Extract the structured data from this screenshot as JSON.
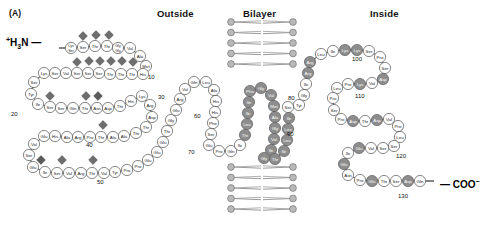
{
  "figure": {
    "panel_label": "(A)",
    "n_terminus": "+H3N",
    "c_terminus": "COO-",
    "regions": [
      {
        "name": "outside",
        "label": "Outside"
      },
      {
        "name": "bilayer",
        "label": "Bilayer"
      },
      {
        "name": "inside",
        "label": "Inside"
      }
    ],
    "colors": {
      "residue_plain_fill": "#ffffff",
      "residue_plain_stroke": "#555555",
      "residue_shaded_fill": "#8d8d8d",
      "residue_dark_fill": "#6f6f6f",
      "glycan_diamond": "#6e6e6e",
      "glycan_diamond_dark": "#5a5a5a",
      "lipid_head": "#b9b9b9",
      "lipid_head_stroke": "#6a6a6a",
      "lipid_tail": "#9a9a9a",
      "text": "#1a1a1a"
    },
    "position_markers": [
      {
        "label": "10",
        "x": 148,
        "y": 74
      },
      {
        "label": "20",
        "x": 11,
        "y": 111
      },
      {
        "label": "30",
        "x": 158,
        "y": 94
      },
      {
        "label": "40",
        "x": 86,
        "y": 142
      },
      {
        "label": "50",
        "x": 97,
        "y": 179
      },
      {
        "label": "60",
        "x": 194,
        "y": 113
      },
      {
        "label": "70",
        "x": 188,
        "y": 149
      },
      {
        "label": "80",
        "x": 288,
        "y": 95
      },
      {
        "label": "90",
        "x": 287,
        "y": 131
      },
      {
        "label": "100",
        "x": 352,
        "y": 56
      },
      {
        "label": "110",
        "x": 355,
        "y": 93
      },
      {
        "label": "120",
        "x": 396,
        "y": 153
      },
      {
        "label": "130",
        "x": 398,
        "y": 193
      }
    ],
    "residues": [
      {
        "i": 1,
        "name": "Lys\nSer",
        "x": 71,
        "y": 48,
        "style": "plain",
        "w": 11
      },
      {
        "i": 2,
        "name": "Ser",
        "x": 83,
        "y": 47,
        "style": "plain"
      },
      {
        "i": 3,
        "name": "Thr",
        "x": 95,
        "y": 46,
        "style": "plain"
      },
      {
        "i": 4,
        "name": "Thr",
        "x": 107,
        "y": 46,
        "style": "plain"
      },
      {
        "i": 5,
        "name": "Gly\nGly",
        "x": 118,
        "y": 48,
        "style": "plain"
      },
      {
        "i": 6,
        "name": "Val",
        "x": 130,
        "y": 48,
        "style": "plain"
      },
      {
        "i": 7,
        "name": "Ala",
        "x": 140,
        "y": 56,
        "style": "plain"
      },
      {
        "i": 8,
        "name": "Met",
        "x": 146,
        "y": 66,
        "style": "plain"
      },
      {
        "i": 9,
        "name": "His",
        "x": 143,
        "y": 74,
        "style": "plain"
      },
      {
        "i": 10,
        "name": "Thr",
        "x": 132,
        "y": 74,
        "style": "plain"
      },
      {
        "i": 11,
        "name": "Thr",
        "x": 121,
        "y": 74,
        "style": "plain"
      },
      {
        "i": 12,
        "name": "Thr",
        "x": 110,
        "y": 74,
        "style": "plain"
      },
      {
        "i": 13,
        "name": "Ser",
        "x": 99,
        "y": 73,
        "style": "plain"
      },
      {
        "i": 14,
        "name": "Ser",
        "x": 88,
        "y": 73,
        "style": "plain"
      },
      {
        "i": 15,
        "name": "Ser",
        "x": 77,
        "y": 73,
        "style": "plain"
      },
      {
        "i": 16,
        "name": "Val",
        "x": 66,
        "y": 73,
        "style": "plain"
      },
      {
        "i": 17,
        "name": "Ser",
        "x": 55,
        "y": 73,
        "style": "plain"
      },
      {
        "i": 18,
        "name": "Lys",
        "x": 44,
        "y": 73,
        "style": "plain"
      },
      {
        "i": 19,
        "name": "Ser",
        "x": 34,
        "y": 82,
        "style": "plain"
      },
      {
        "i": 20,
        "name": "Tyr",
        "x": 31,
        "y": 94,
        "style": "plain"
      },
      {
        "i": 21,
        "name": "Ile",
        "x": 38,
        "y": 104,
        "style": "plain"
      },
      {
        "i": 22,
        "name": "Ser",
        "x": 50,
        "y": 107,
        "style": "plain"
      },
      {
        "i": 23,
        "name": "Ser",
        "x": 61,
        "y": 108,
        "style": "plain"
      },
      {
        "i": 24,
        "name": "Gln",
        "x": 73,
        "y": 108,
        "style": "plain"
      },
      {
        "i": 25,
        "name": "Thr",
        "x": 85,
        "y": 108,
        "style": "plain"
      },
      {
        "i": 26,
        "name": "Asn",
        "x": 97,
        "y": 108,
        "style": "plain"
      },
      {
        "i": 27,
        "name": "Asp",
        "x": 108,
        "y": 108,
        "style": "plain"
      },
      {
        "i": 28,
        "name": "Thr",
        "x": 120,
        "y": 106,
        "style": "plain"
      },
      {
        "i": 29,
        "name": "His",
        "x": 131,
        "y": 101,
        "style": "plain"
      },
      {
        "i": 30,
        "name": "Lys",
        "x": 142,
        "y": 96,
        "style": "plain"
      },
      {
        "i": 31,
        "name": "Arg",
        "x": 150,
        "y": 105,
        "style": "plain"
      },
      {
        "i": 32,
        "name": "Asp",
        "x": 152,
        "y": 117,
        "style": "plain"
      },
      {
        "i": 33,
        "name": "Thr",
        "x": 146,
        "y": 127,
        "style": "plain"
      },
      {
        "i": 34,
        "name": "Thr",
        "x": 136,
        "y": 133,
        "style": "plain"
      },
      {
        "i": 35,
        "name": "Ala",
        "x": 124,
        "y": 136,
        "style": "plain"
      },
      {
        "i": 36,
        "name": "Ala",
        "x": 113,
        "y": 137,
        "style": "plain"
      },
      {
        "i": 37,
        "name": "Thr",
        "x": 101,
        "y": 137,
        "style": "plain"
      },
      {
        "i": 38,
        "name": "Pro",
        "x": 90,
        "y": 137,
        "style": "plain"
      },
      {
        "i": 39,
        "name": "Arg",
        "x": 78,
        "y": 137,
        "style": "plain"
      },
      {
        "i": 40,
        "name": "Ala",
        "x": 67,
        "y": 137,
        "style": "plain"
      },
      {
        "i": 41,
        "name": "His",
        "x": 55,
        "y": 136,
        "style": "plain"
      },
      {
        "i": 42,
        "name": "Glu",
        "x": 44,
        "y": 136,
        "style": "plain"
      },
      {
        "i": 43,
        "name": "Val",
        "x": 34,
        "y": 144,
        "style": "plain"
      },
      {
        "i": 44,
        "name": "Ser",
        "x": 29,
        "y": 155,
        "style": "plain"
      },
      {
        "i": 45,
        "name": "Glu",
        "x": 33,
        "y": 167,
        "style": "plain"
      },
      {
        "i": 46,
        "name": "Ile",
        "x": 45,
        "y": 172,
        "style": "plain"
      },
      {
        "i": 47,
        "name": "Ser",
        "x": 57,
        "y": 173,
        "style": "plain"
      },
      {
        "i": 48,
        "name": "Val",
        "x": 69,
        "y": 173,
        "style": "plain"
      },
      {
        "i": 49,
        "name": "Arg",
        "x": 81,
        "y": 173,
        "style": "plain"
      },
      {
        "i": 50,
        "name": "Thr",
        "x": 92,
        "y": 173,
        "style": "plain"
      },
      {
        "i": 51,
        "name": "Val",
        "x": 104,
        "y": 173,
        "style": "plain"
      },
      {
        "i": 52,
        "name": "Tyr",
        "x": 115,
        "y": 172,
        "style": "plain"
      },
      {
        "i": 53,
        "name": "Pro",
        "x": 127,
        "y": 170,
        "style": "plain"
      },
      {
        "i": 54,
        "name": "Pro",
        "x": 138,
        "y": 166,
        "style": "plain"
      },
      {
        "i": 55,
        "name": "Glu",
        "x": 148,
        "y": 160,
        "style": "plain"
      },
      {
        "i": 56,
        "name": "Glu",
        "x": 157,
        "y": 152,
        "style": "plain"
      },
      {
        "i": 57,
        "name": "Glu",
        "x": 163,
        "y": 142,
        "style": "plain"
      },
      {
        "i": 58,
        "name": "Thr",
        "x": 167,
        "y": 131,
        "style": "plain"
      },
      {
        "i": 59,
        "name": "Gly",
        "x": 171,
        "y": 120,
        "style": "plain"
      },
      {
        "i": 60,
        "name": "Glu",
        "x": 176,
        "y": 110,
        "style": "plain"
      },
      {
        "i": 61,
        "name": "Arg",
        "x": 180,
        "y": 99,
        "style": "plain"
      },
      {
        "i": 62,
        "name": "Val",
        "x": 185,
        "y": 89,
        "style": "plain"
      },
      {
        "i": 63,
        "name": "Gln",
        "x": 194,
        "y": 82,
        "style": "plain"
      },
      {
        "i": 64,
        "name": "Leu",
        "x": 206,
        "y": 82,
        "style": "plain"
      },
      {
        "i": 65,
        "name": "Ala",
        "x": 214,
        "y": 90,
        "style": "plain"
      },
      {
        "i": 66,
        "name": "His",
        "x": 216,
        "y": 101,
        "style": "plain"
      },
      {
        "i": 67,
        "name": "His",
        "x": 215,
        "y": 112,
        "style": "plain"
      },
      {
        "i": 68,
        "name": "Phe",
        "x": 213,
        "y": 123,
        "style": "plain"
      },
      {
        "i": 69,
        "name": "Ser",
        "x": 211,
        "y": 134,
        "style": "plain"
      },
      {
        "i": 70,
        "name": "Glu",
        "x": 209,
        "y": 145,
        "style": "plain"
      },
      {
        "i": 71,
        "name": "Pro",
        "x": 219,
        "y": 151,
        "style": "plain"
      },
      {
        "i": 72,
        "name": "Gln",
        "x": 231,
        "y": 151,
        "style": "plain"
      },
      {
        "i": 73,
        "name": "Ile",
        "x": 240,
        "y": 145,
        "style": "plain"
      },
      {
        "i": 74,
        "name": "Thr",
        "x": 245,
        "y": 135,
        "style": "shaded"
      },
      {
        "i": 75,
        "name": "Leu",
        "x": 247,
        "y": 124,
        "style": "shaded"
      },
      {
        "i": 76,
        "name": "Ile",
        "x": 248,
        "y": 113,
        "style": "shaded"
      },
      {
        "i": 77,
        "name": "Ile",
        "x": 249,
        "y": 102,
        "style": "shaded"
      },
      {
        "i": 78,
        "name": "Phe",
        "x": 250,
        "y": 91,
        "style": "shaded"
      },
      {
        "i": 79,
        "name": "Gly",
        "x": 261,
        "y": 88,
        "style": "shaded"
      },
      {
        "i": 80,
        "name": "Val",
        "x": 271,
        "y": 95,
        "style": "shaded"
      },
      {
        "i": 81,
        "name": "Met",
        "x": 274,
        "y": 106,
        "style": "shaded"
      },
      {
        "i": 82,
        "name": "Ala",
        "x": 275,
        "y": 117,
        "style": "shaded"
      },
      {
        "i": 83,
        "name": "Gly",
        "x": 275,
        "y": 128,
        "style": "shaded"
      },
      {
        "i": 84,
        "name": "Val",
        "x": 274,
        "y": 139,
        "style": "shaded"
      },
      {
        "i": 85,
        "name": "Ile",
        "x": 271,
        "y": 150,
        "style": "shaded"
      },
      {
        "i": 86,
        "name": "Gly",
        "x": 264,
        "y": 158,
        "style": "shaded"
      },
      {
        "i": 87,
        "name": "Thr",
        "x": 275,
        "y": 159,
        "style": "shaded"
      },
      {
        "i": 88,
        "name": "Ile",
        "x": 284,
        "y": 151,
        "style": "shaded"
      },
      {
        "i": 89,
        "name": "Leu",
        "x": 287,
        "y": 140,
        "style": "shaded"
      },
      {
        "i": 90,
        "name": "Leu",
        "x": 288,
        "y": 129,
        "style": "shaded"
      },
      {
        "i": 91,
        "name": "Ile",
        "x": 289,
        "y": 118,
        "style": "shaded"
      },
      {
        "i": 92,
        "name": "Ser",
        "x": 288,
        "y": 107,
        "style": "plain"
      },
      {
        "i": 93,
        "name": "Tyr",
        "x": 299,
        "y": 105,
        "style": "plain"
      },
      {
        "i": 94,
        "name": "Gly",
        "x": 304,
        "y": 95,
        "style": "plain"
      },
      {
        "i": 95,
        "name": "Ile",
        "x": 306,
        "y": 84,
        "style": "plain"
      },
      {
        "i": 96,
        "name": "Arg",
        "x": 308,
        "y": 73,
        "style": "shaded"
      },
      {
        "i": 97,
        "name": "Arg",
        "x": 310,
        "y": 62,
        "style": "shaded"
      },
      {
        "i": 98,
        "name": "Leu",
        "x": 321,
        "y": 54,
        "style": "plain"
      },
      {
        "i": 99,
        "name": "Ile",
        "x": 333,
        "y": 51,
        "style": "plain"
      },
      {
        "i": 100,
        "name": "Lys",
        "x": 345,
        "y": 50,
        "style": "shaded"
      },
      {
        "i": 101,
        "name": "Lys",
        "x": 357,
        "y": 50,
        "style": "shaded"
      },
      {
        "i": 102,
        "name": "Ser",
        "x": 369,
        "y": 51,
        "style": "plain"
      },
      {
        "i": 103,
        "name": "Pro",
        "x": 380,
        "y": 57,
        "style": "plain"
      },
      {
        "i": 104,
        "name": "Ser",
        "x": 385,
        "y": 68,
        "style": "plain"
      },
      {
        "i": 105,
        "name": "Asp",
        "x": 383,
        "y": 79,
        "style": "shaded"
      },
      {
        "i": 106,
        "name": "Val",
        "x": 372,
        "y": 83,
        "style": "plain"
      },
      {
        "i": 107,
        "name": "Lys",
        "x": 360,
        "y": 84,
        "style": "shaded"
      },
      {
        "i": 108,
        "name": "Pro",
        "x": 348,
        "y": 84,
        "style": "plain"
      },
      {
        "i": 109,
        "name": "Leu",
        "x": 337,
        "y": 88,
        "style": "plain"
      },
      {
        "i": 110,
        "name": "Pro",
        "x": 333,
        "y": 98,
        "style": "plain"
      },
      {
        "i": 111,
        "name": "Ser",
        "x": 334,
        "y": 110,
        "style": "plain"
      },
      {
        "i": 112,
        "name": "Pro",
        "x": 341,
        "y": 119,
        "style": "plain"
      },
      {
        "i": 113,
        "name": "Asp",
        "x": 353,
        "y": 121,
        "style": "shaded"
      },
      {
        "i": 114,
        "name": "Thr",
        "x": 365,
        "y": 121,
        "style": "plain"
      },
      {
        "i": 115,
        "name": "Asp",
        "x": 377,
        "y": 120,
        "style": "shaded"
      },
      {
        "i": 116,
        "name": "Val",
        "x": 389,
        "y": 119,
        "style": "plain"
      },
      {
        "i": 117,
        "name": "Pro",
        "x": 398,
        "y": 126,
        "style": "plain"
      },
      {
        "i": 118,
        "name": "Leu",
        "x": 400,
        "y": 137,
        "style": "plain"
      },
      {
        "i": 119,
        "name": "Ser",
        "x": 394,
        "y": 146,
        "style": "plain"
      },
      {
        "i": 120,
        "name": "Ser",
        "x": 383,
        "y": 148,
        "style": "plain"
      },
      {
        "i": 121,
        "name": "Val",
        "x": 371,
        "y": 148,
        "style": "plain"
      },
      {
        "i": 122,
        "name": "Glu",
        "x": 359,
        "y": 148,
        "style": "shaded"
      },
      {
        "i": 123,
        "name": "Ile",
        "x": 348,
        "y": 153,
        "style": "plain"
      },
      {
        "i": 124,
        "name": "Glu",
        "x": 344,
        "y": 164,
        "style": "shaded"
      },
      {
        "i": 125,
        "name": "Asn",
        "x": 348,
        "y": 175,
        "style": "plain"
      },
      {
        "i": 126,
        "name": "Pro",
        "x": 360,
        "y": 180,
        "style": "plain"
      },
      {
        "i": 127,
        "name": "Glu",
        "x": 372,
        "y": 181,
        "style": "shaded"
      },
      {
        "i": 128,
        "name": "Thr",
        "x": 384,
        "y": 181,
        "style": "plain"
      },
      {
        "i": 129,
        "name": "Ser",
        "x": 396,
        "y": 181,
        "style": "plain"
      },
      {
        "i": 130,
        "name": "Asp",
        "x": 408,
        "y": 181,
        "style": "shaded"
      },
      {
        "i": 131,
        "name": "Gln",
        "x": 420,
        "y": 181,
        "style": "plain"
      }
    ],
    "glycans": [
      {
        "x": 83,
        "y": 36,
        "style": "light"
      },
      {
        "x": 96,
        "y": 35,
        "style": "light"
      },
      {
        "x": 109,
        "y": 35,
        "style": "light"
      },
      {
        "x": 77,
        "y": 62,
        "style": "light"
      },
      {
        "x": 89,
        "y": 61,
        "style": "light"
      },
      {
        "x": 100,
        "y": 61,
        "style": "light"
      },
      {
        "x": 111,
        "y": 61,
        "style": "light"
      },
      {
        "x": 122,
        "y": 61,
        "style": "light"
      },
      {
        "x": 133,
        "y": 62,
        "style": "light"
      },
      {
        "x": 50,
        "y": 96,
        "style": "light"
      },
      {
        "x": 86,
        "y": 96,
        "style": "light"
      },
      {
        "x": 98,
        "y": 96,
        "style": "dark"
      },
      {
        "x": 103,
        "y": 125,
        "style": "light"
      },
      {
        "x": 41,
        "y": 160,
        "style": "dark"
      },
      {
        "x": 62,
        "y": 160,
        "style": "light"
      },
      {
        "x": 93,
        "y": 160,
        "style": "light"
      }
    ],
    "bilayer": {
      "top_panel": {
        "x": 228,
        "y": 22,
        "w": 68,
        "h": 42,
        "rows": 5
      },
      "bottom_panel": {
        "x": 228,
        "y": 167,
        "w": 68,
        "h": 42,
        "rows": 5
      }
    }
  }
}
